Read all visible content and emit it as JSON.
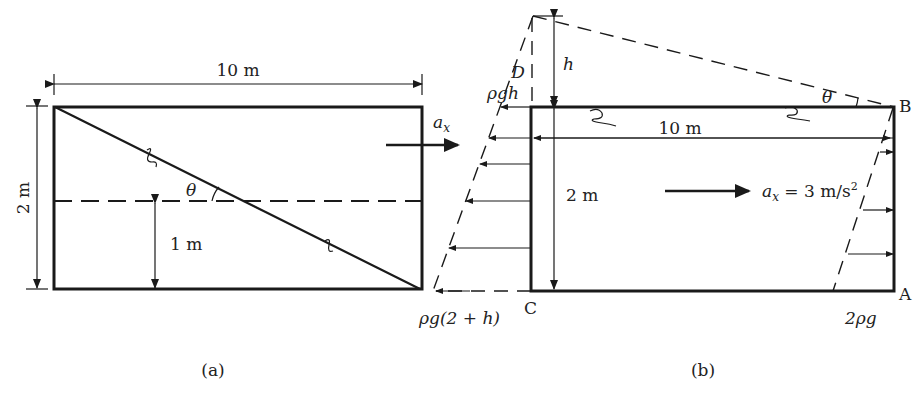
{
  "figure_a": {
    "caption": "(a)",
    "width_label": "10 m",
    "height_label": "2 m",
    "depth_label": "1 m",
    "angle_label": "θ",
    "accel_label": "a",
    "accel_sub": "x"
  },
  "figure_b": {
    "caption": "(b)",
    "height_label": "h",
    "point_d": "D",
    "point_b": "B",
    "point_c": "C",
    "point_a": "A",
    "pressure_top_left": "ρgh",
    "pressure_bottom_left": "ρg(2 + h)",
    "pressure_bottom_right": "2ρg",
    "width_label": "10 m",
    "depth_label": "2 m",
    "angle_label": "θ",
    "accel_label": "a",
    "accel_sub": "x",
    "accel_value": " = 3 m/s",
    "accel_exp": "2"
  }
}
